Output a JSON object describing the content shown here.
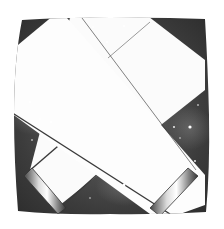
{
  "illustration": {
    "subject": "Two crossed white telescope tubes over a starry night sky",
    "style": "pencil drawing",
    "colors": {
      "background": "#ffffff",
      "sky_dark": "#2e2e2e",
      "sky_mid": "#5a5a5a",
      "tube_fill": "#fbfbfb",
      "tube_edge": "#3a3a3a",
      "star": "#ffffff"
    },
    "elements": [
      "night-sky-frame",
      "front-tube",
      "back-tube",
      "eyepiece-ring-left",
      "eyepiece-ring-right",
      "stars"
    ]
  }
}
